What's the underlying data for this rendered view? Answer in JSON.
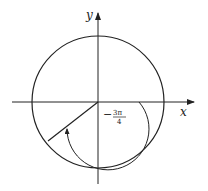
{
  "diagram": {
    "type": "unit-circle-angle",
    "axes": {
      "x_label": "x",
      "y_label": "y"
    },
    "angle": {
      "sign": "−",
      "numerator": "3π",
      "denominator": "4",
      "value_radians": "-3π/4",
      "direction": "clockwise"
    },
    "colors": {
      "stroke": "#222222",
      "background": "#ffffff"
    }
  }
}
